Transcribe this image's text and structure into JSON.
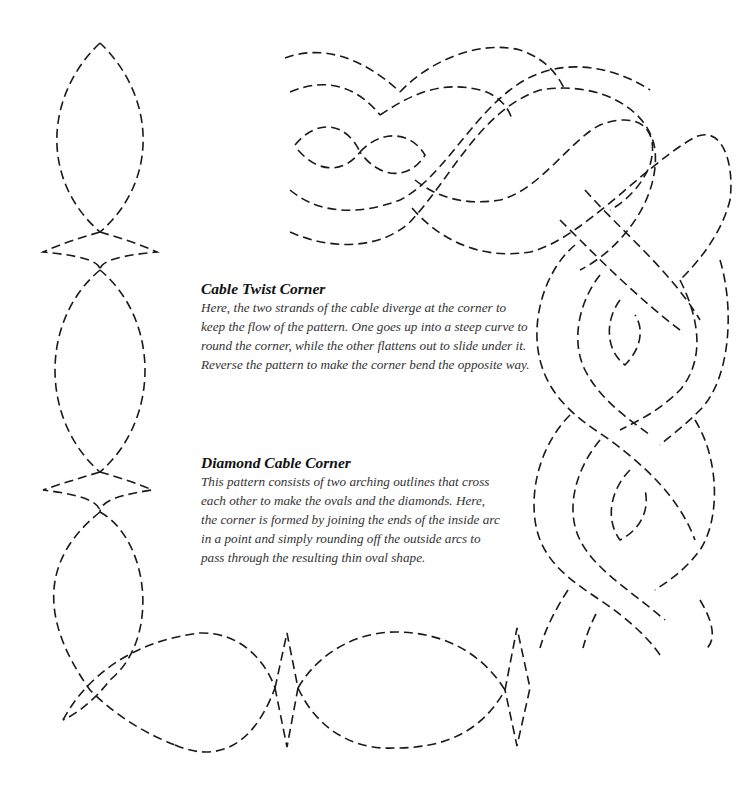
{
  "captions": [
    {
      "title": "Cable Twist Corner",
      "body": "Here, the two strands of the cable diverge at the corner to keep the flow of the pattern. One goes up into a steep curve to round the corner, while the other flattens out to slide under it. Reverse the pattern to make the corner bend the opposite way."
    },
    {
      "title": "Diamond Cable Corner",
      "body": "This pattern consists of two arching outlines that cross each other to make the ovals and the diamonds. Here, the corner is formed by joining the ends of the inside arc in a point and simply rounding off the outside arcs to pass through the resulting thin oval shape."
    }
  ],
  "figures": {
    "cable_twist_corner": "dashed cable twist quilting pattern turning a corner (top-right)",
    "diamond_cable_corner": "dashed diamond cable quilting pattern turning a corner (left and bottom)"
  },
  "colors": {
    "line": "#1a1a1a",
    "text": "#333333",
    "background": "#ffffff"
  }
}
